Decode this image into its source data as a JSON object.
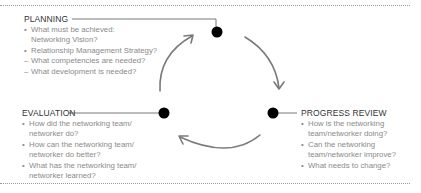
{
  "colors": {
    "title": "#333333",
    "body_text": "#8a8a8a",
    "arrow": "#7a7a7a",
    "dot": "#000000",
    "rule": "#9a9a9a"
  },
  "planning": {
    "title": "PLANNING",
    "items": [
      {
        "mark": "•",
        "line1": "What must be achieved:",
        "line2": "Networking Vision?"
      },
      {
        "mark": "•",
        "line1": "Relationship Management Strategy?",
        "line2": ""
      },
      {
        "mark": "–",
        "line1": "What competencies are needed?",
        "line2": ""
      },
      {
        "mark": "–",
        "line1": "What development is needed?",
        "line2": ""
      }
    ]
  },
  "progress_review": {
    "title": "PROGRESS REVIEW",
    "items": [
      {
        "mark": "•",
        "line1": "How is the networking",
        "line2": "team/networker doing?"
      },
      {
        "mark": "•",
        "line1": "Can the networking",
        "line2": "team/networker improve?"
      },
      {
        "mark": "•",
        "line1": "What needs to change?",
        "line2": ""
      }
    ]
  },
  "evaluation": {
    "title": "EVALUATION",
    "items": [
      {
        "mark": "•",
        "line1": "How did the networking team/",
        "line2": "networker do?"
      },
      {
        "mark": "•",
        "line1": "How can the networking team/",
        "line2": "networker do better?"
      },
      {
        "mark": "•",
        "line1": "What has the networking team/",
        "line2": "networker learned?"
      }
    ]
  },
  "cycle": {
    "nodes": [
      "planning",
      "progress_review",
      "evaluation"
    ],
    "arrows": [
      "planning-to-progress_review",
      "progress_review-to-evaluation",
      "evaluation-to-planning"
    ]
  }
}
